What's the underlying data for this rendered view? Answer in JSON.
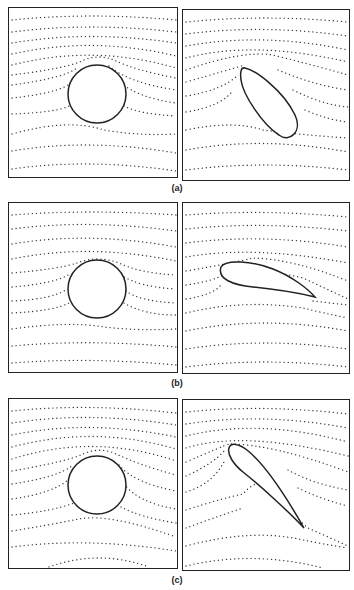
{
  "figure": {
    "rows": [
      {
        "label": "(a)",
        "left": {
          "shape": "circle",
          "description": "Streamlines around circular cylinder"
        },
        "right": {
          "shape": "ellipse-egg",
          "description": "Streamlines around conformally mapped egg-shaped body"
        }
      },
      {
        "label": "(b)",
        "left": {
          "shape": "circle",
          "description": "Streamlines around circular cylinder"
        },
        "right": {
          "shape": "airfoil-small-angle",
          "description": "Streamlines around airfoil at small angle of attack"
        }
      },
      {
        "label": "(c)",
        "left": {
          "shape": "circle",
          "description": "Streamlines around circular cylinder"
        },
        "right": {
          "shape": "airfoil-large-angle",
          "description": "Streamlines around airfoil at large angle of attack"
        }
      }
    ],
    "colors": {
      "stroke": "#222222",
      "dots": "#333333",
      "background": "#ffffff"
    }
  }
}
